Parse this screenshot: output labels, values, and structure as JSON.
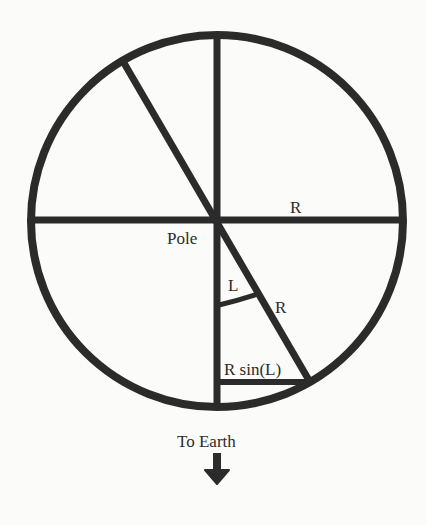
{
  "diagram": {
    "type": "geometry",
    "colors": {
      "stroke": "#2b2b2b",
      "background": "#fbfbf9"
    },
    "labels": {
      "radius_horizontal": "R",
      "pole": "Pole",
      "angle": "L",
      "radius_diagonal": "R",
      "projection": "R sin(L)",
      "direction": "To Earth"
    },
    "icons": {
      "direction_arrow": "arrow-down-icon"
    }
  }
}
